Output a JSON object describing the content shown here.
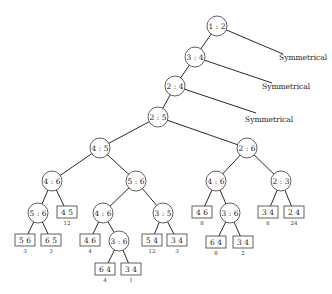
{
  "diagram": {
    "type": "decision-tree",
    "symmetrical_label": "Symmetrical",
    "internal_nodes": [
      {
        "id": "n12",
        "label": "1 : 2",
        "x": 217,
        "y": 26
      },
      {
        "id": "n34",
        "label": "3 : 4",
        "x": 195,
        "y": 57
      },
      {
        "id": "n24",
        "label": "2 : 4",
        "x": 175,
        "y": 86
      },
      {
        "id": "n25",
        "label": "2 : 5",
        "x": 158,
        "y": 117
      },
      {
        "id": "n45",
        "label": "4 : 5",
        "x": 100,
        "y": 148
      },
      {
        "id": "n26",
        "label": "2 : 6",
        "x": 247,
        "y": 148
      },
      {
        "id": "n46a",
        "label": "4 : 6",
        "x": 52,
        "y": 181
      },
      {
        "id": "n56a",
        "label": "5 : 6",
        "x": 136,
        "y": 181
      },
      {
        "id": "n46b",
        "label": "4 : 6",
        "x": 216,
        "y": 181
      },
      {
        "id": "n23",
        "label": "2 : 3",
        "x": 281,
        "y": 181
      },
      {
        "id": "n56b",
        "label": "5 : 6",
        "x": 38,
        "y": 213
      },
      {
        "id": "n46c",
        "label": "4 : 6",
        "x": 103,
        "y": 213
      },
      {
        "id": "n35",
        "label": "3 : 5",
        "x": 163,
        "y": 213
      },
      {
        "id": "n36a",
        "label": "3 : 6",
        "x": 230,
        "y": 213
      },
      {
        "id": "n36b",
        "label": "3 : 6",
        "x": 119,
        "y": 241
      }
    ],
    "leaves": [
      {
        "label": "4 5",
        "weight": "12",
        "x": 67,
        "y": 212
      },
      {
        "label": "4 6",
        "weight": "8",
        "x": 202,
        "y": 212
      },
      {
        "label": "3 4",
        "weight": "6",
        "x": 268,
        "y": 212
      },
      {
        "label": "2 4",
        "weight": "24",
        "x": 294,
        "y": 212
      },
      {
        "label": "5 6",
        "weight": "3",
        "x": 25,
        "y": 240
      },
      {
        "label": "6 5",
        "weight": "3",
        "x": 51,
        "y": 240
      },
      {
        "label": "4 6",
        "weight": "4",
        "x": 90,
        "y": 240
      },
      {
        "label": "5 4",
        "weight": "12",
        "x": 152,
        "y": 240
      },
      {
        "label": "3 4",
        "weight": "3",
        "x": 177,
        "y": 240
      },
      {
        "label": "6 4",
        "weight": "8",
        "x": 216,
        "y": 242
      },
      {
        "label": "3 4",
        "weight": "2",
        "x": 243,
        "y": 242
      },
      {
        "label": "6 4",
        "weight": "4",
        "x": 105,
        "y": 269
      },
      {
        "label": "3 4",
        "weight": "1",
        "x": 131,
        "y": 269
      }
    ],
    "edges": [
      [
        217,
        26,
        195,
        57
      ],
      [
        195,
        57,
        175,
        86
      ],
      [
        175,
        86,
        158,
        117
      ],
      [
        158,
        117,
        100,
        148
      ],
      [
        158,
        117,
        247,
        148
      ],
      [
        100,
        148,
        52,
        181
      ],
      [
        100,
        148,
        136,
        181
      ],
      [
        247,
        148,
        216,
        181
      ],
      [
        247,
        148,
        281,
        181
      ],
      [
        52,
        181,
        38,
        213
      ],
      [
        52,
        181,
        67,
        212
      ],
      [
        136,
        181,
        103,
        213
      ],
      [
        136,
        181,
        163,
        213
      ],
      [
        216,
        181,
        202,
        212
      ],
      [
        216,
        181,
        230,
        213
      ],
      [
        281,
        181,
        268,
        212
      ],
      [
        281,
        181,
        294,
        212
      ],
      [
        38,
        213,
        25,
        240
      ],
      [
        38,
        213,
        51,
        240
      ],
      [
        103,
        213,
        90,
        240
      ],
      [
        103,
        213,
        119,
        241
      ],
      [
        163,
        213,
        152,
        240
      ],
      [
        163,
        213,
        177,
        240
      ],
      [
        230,
        213,
        216,
        242
      ],
      [
        230,
        213,
        243,
        242
      ],
      [
        119,
        241,
        105,
        269
      ],
      [
        119,
        241,
        131,
        269
      ]
    ],
    "symmetry_branches": [
      {
        "from_x": 217,
        "from_y": 26,
        "to_x": 283,
        "to_y": 54,
        "label_x": 279,
        "label_y": 57
      },
      {
        "from_x": 195,
        "from_y": 57,
        "to_x": 272,
        "to_y": 83,
        "label_x": 262,
        "label_y": 86
      },
      {
        "from_x": 175,
        "from_y": 86,
        "to_x": 256,
        "to_y": 113,
        "label_x": 245,
        "label_y": 119
      }
    ]
  }
}
